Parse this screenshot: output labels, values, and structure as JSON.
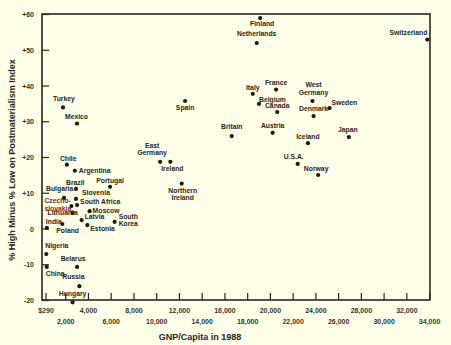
{
  "chart_data": {
    "type": "scatter",
    "title": "",
    "xlabel": "GNP/Capita in 1988",
    "ylabel": "% High Minus % Low on Postmaterialism Index",
    "xlim": [
      0,
      34000
    ],
    "ylim": [
      -20,
      60
    ],
    "grid": false,
    "legend": null,
    "x_ticks": [
      {
        "value": 290,
        "label": "$290",
        "row": 0
      },
      {
        "value": 2000,
        "label": "2,000",
        "row": 1
      },
      {
        "value": 4000,
        "label": "4,000",
        "row": 0
      },
      {
        "value": 6000,
        "label": "6,000",
        "row": 1
      },
      {
        "value": 8000,
        "label": "8,000",
        "row": 0
      },
      {
        "value": 10000,
        "label": "10,000",
        "row": 1
      },
      {
        "value": 12000,
        "label": "12,000",
        "row": 0
      },
      {
        "value": 14000,
        "label": "14,000",
        "row": 1
      },
      {
        "value": 16000,
        "label": "16,000",
        "row": 0
      },
      {
        "value": 18000,
        "label": "18,000",
        "row": 1
      },
      {
        "value": 20000,
        "label": "20,000",
        "row": 0
      },
      {
        "value": 22000,
        "label": "22,000",
        "row": 1
      },
      {
        "value": 24000,
        "label": "24,000",
        "row": 0
      },
      {
        "value": 26000,
        "label": "26,000",
        "row": 1
      },
      {
        "value": 28000,
        "label": "28,000",
        "row": 0
      },
      {
        "value": 30000,
        "label": "30,000",
        "row": 1
      },
      {
        "value": 32000,
        "label": "32,000",
        "row": 0
      },
      {
        "value": 34000,
        "label": "34,000",
        "row": 1
      }
    ],
    "y_ticks": [
      {
        "value": 60,
        "label": "+60"
      },
      {
        "value": 50,
        "label": "+50"
      },
      {
        "value": 40,
        "label": "+40"
      },
      {
        "value": 30,
        "label": "+30"
      },
      {
        "value": 20,
        "label": "+20"
      },
      {
        "value": 10,
        "label": "+10"
      },
      {
        "value": 0,
        "label": "0"
      },
      {
        "value": -10,
        "label": "-10"
      },
      {
        "value": -20,
        "label": "-20"
      }
    ],
    "points": [
      {
        "label": "Finland",
        "x": 19100,
        "y": 59,
        "lx": 2,
        "ly": 8,
        "anchor": "middle"
      },
      {
        "label": "Netherlands",
        "x": 18800,
        "y": 52,
        "lx": 0,
        "ly": -7,
        "anchor": "middle"
      },
      {
        "label": "Switzerland",
        "x": 33800,
        "y": 53,
        "lx": 0,
        "ly": -5,
        "anchor": "end"
      },
      {
        "label": "Turkey",
        "x": 1760,
        "y": 34,
        "lx": -10,
        "ly": -6,
        "anchor": "start"
      },
      {
        "label": "Mexico",
        "x": 2990,
        "y": 29.5,
        "lx": -12,
        "ly": -5,
        "anchor": "start"
      },
      {
        "label": "Spain",
        "x": 12500,
        "y": 35.8,
        "lx": 0,
        "ly": 9,
        "anchor": "middle"
      },
      {
        "label": "Italy",
        "x": 18450,
        "y": 37.8,
        "lx": 0,
        "ly": -4,
        "anchor": "middle"
      },
      {
        "label": "France",
        "x": 20500,
        "y": 39,
        "lx": 0,
        "ly": -5,
        "anchor": "middle"
      },
      {
        "label": "Belgium",
        "x": 19000,
        "y": 35,
        "lx": 0,
        "ly": -2,
        "anchor": "start"
      },
      {
        "label": "Canada",
        "x": 20600,
        "y": 32.7,
        "lx": 0,
        "ly": -4,
        "anchor": "middle"
      },
      {
        "label": "West Germany",
        "x": 23700,
        "y": 35.8,
        "lx": 1,
        "ly": -14,
        "anchor": "middle",
        "line2": "Germany"
      },
      {
        "label": "Sweden",
        "x": 25200,
        "y": 33.8,
        "lx": 2,
        "ly": -3,
        "anchor": "start"
      },
      {
        "label": "Denmark",
        "x": 23800,
        "y": 31.6,
        "lx": 0,
        "ly": -5,
        "anchor": "middle"
      },
      {
        "label": "Britain",
        "x": 16600,
        "y": 26,
        "lx": 0,
        "ly": -7,
        "anchor": "middle"
      },
      {
        "label": "Austria",
        "x": 20200,
        "y": 26.9,
        "lx": 0,
        "ly": -5,
        "anchor": "middle"
      },
      {
        "label": "Iceland",
        "x": 23300,
        "y": 24,
        "lx": 0,
        "ly": -4,
        "anchor": "middle"
      },
      {
        "label": "Japan",
        "x": 26900,
        "y": 25.7,
        "lx": -1,
        "ly": -5,
        "anchor": "middle"
      },
      {
        "label": "U.S.A.",
        "x": 22400,
        "y": 18.2,
        "lx": -4,
        "ly": -5,
        "anchor": "middle"
      },
      {
        "label": "Norway",
        "x": 24200,
        "y": 15.1,
        "lx": -2,
        "ly": -4,
        "anchor": "middle"
      },
      {
        "label": "East Germany",
        "x": 10300,
        "y": 18.8,
        "lx": -8,
        "ly": -14,
        "anchor": "middle",
        "line2": "Germany"
      },
      {
        "label": "Ireland",
        "x": 11200,
        "y": 18.8,
        "lx": 2,
        "ly": 9,
        "anchor": "middle"
      },
      {
        "label": "Northern Ireland",
        "x": 12200,
        "y": 12.7,
        "lx": 1,
        "ly": 9,
        "anchor": "middle",
        "line2": "Ireland"
      },
      {
        "label": "Chile",
        "x": 2100,
        "y": 18,
        "lx": -7,
        "ly": -4,
        "anchor": "start"
      },
      {
        "label": "Argentina",
        "x": 2800,
        "y": 16.3,
        "lx": 4,
        "ly": 2,
        "anchor": "start"
      },
      {
        "label": "Brazil",
        "x": 2900,
        "y": 11.2,
        "lx": -10,
        "ly": -4,
        "anchor": "start"
      },
      {
        "label": "Portugal",
        "x": 5900,
        "y": 11.8,
        "lx": 0,
        "ly": -4,
        "anchor": "middle"
      },
      {
        "label": "Bulgaria",
        "x": 1850,
        "y": 8.7,
        "lx": -18,
        "ly": -7,
        "anchor": "start"
      },
      {
        "label": "Slovenia",
        "x": 2900,
        "y": 8.4,
        "lx": 6,
        "ly": -4,
        "anchor": "start"
      },
      {
        "label": "South Africa",
        "x": 3000,
        "y": 6.7,
        "lx": 3,
        "ly": -1,
        "anchor": "start"
      },
      {
        "label": "Czechoslovakia",
        "x": 2500,
        "y": 6.4,
        "lx": -27,
        "ly": -3,
        "anchor": "start",
        "line2": "slovakia",
        "color": "red"
      },
      {
        "label": "Moscow",
        "x": 4100,
        "y": 5,
        "lx": 3,
        "ly": 2,
        "anchor": "start"
      },
      {
        "label": "Lithuania",
        "x": 2600,
        "y": 4.5,
        "lx": -25,
        "ly": 2,
        "anchor": "start"
      },
      {
        "label": "Latvia",
        "x": 3400,
        "y": 2.5,
        "lx": 3,
        "ly": -1,
        "anchor": "start"
      },
      {
        "label": "Estonia",
        "x": 3900,
        "y": 1.1,
        "lx": 3,
        "ly": 6,
        "anchor": "start"
      },
      {
        "label": "South Korea",
        "x": 6300,
        "y": 2,
        "lx": 4,
        "ly": -3,
        "anchor": "start",
        "line2": "Korea"
      },
      {
        "label": "India",
        "x": 340,
        "y": 0.3,
        "lx": -1,
        "ly": -4,
        "anchor": "start"
      },
      {
        "label": "Poland",
        "x": 1700,
        "y": 1.4,
        "lx": -6,
        "ly": 9,
        "anchor": "start"
      },
      {
        "label": "Nigeria",
        "x": 290,
        "y": -7,
        "lx": -1,
        "ly": -6,
        "anchor": "start"
      },
      {
        "label": "China",
        "x": 330,
        "y": -10.6,
        "lx": -1,
        "ly": 9,
        "anchor": "start"
      },
      {
        "label": "Belarus",
        "x": 3000,
        "y": -10.6,
        "lx": -4,
        "ly": -6,
        "anchor": "middle"
      },
      {
        "label": "Russia",
        "x": 3200,
        "y": -16,
        "lx": -6,
        "ly": -7,
        "anchor": "middle"
      },
      {
        "label": "Hungary",
        "x": 2600,
        "y": -20.5,
        "lx": 0,
        "ly": -6,
        "anchor": "middle"
      }
    ]
  },
  "colors": {
    "background": "#fefee9",
    "ink": "#2b2620",
    "accent_red": "#7a2a2a"
  }
}
